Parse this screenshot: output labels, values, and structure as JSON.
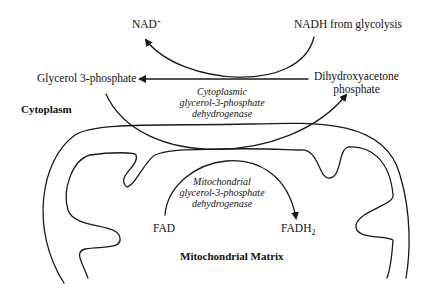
{
  "diagram": {
    "colors": {
      "line": "#1a1a1a",
      "background": "#ffffff"
    },
    "labels": {
      "nad": "NAD",
      "nad_sup": "+",
      "nadh": "NADH from glycolysis",
      "glycerol3p": "Glycerol 3-phosphate",
      "dhap_line1": "Dihydroxyacetone",
      "dhap_line2": "phosphate",
      "cytoplasm": "Cytoplasm",
      "cyto_enzyme_line1": "Cytoplasmic",
      "cyto_enzyme_line2": "glycerol-3-phosphate",
      "cyto_enzyme_line3": "dehydrogenase",
      "mito_enzyme_line1": "Mitochondrial",
      "mito_enzyme_line2": "glycerol-3-phosphate",
      "mito_enzyme_line3": "dehydrogenase",
      "fad": "FAD",
      "fadh": "FADH",
      "fadh_sub": "2",
      "matrix": "Mitochondrial Matrix"
    }
  }
}
